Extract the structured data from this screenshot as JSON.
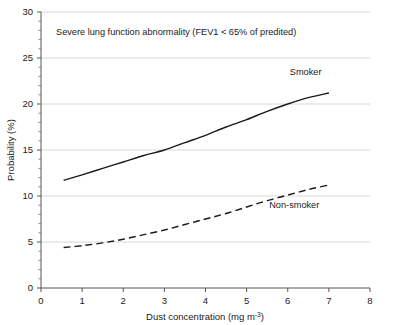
{
  "chart_data": {
    "type": "line",
    "title": "",
    "annotation": "Severe lung function abnormality (FEV1 < 65% of predited)",
    "xlabel_text": "Dust concentration (mg m",
    "xlabel_sup": "-3",
    "xlabel_tail": ")",
    "xlabel": "Dust concentration (mg m-3)",
    "ylabel": "Probability (%)",
    "xlim": [
      0,
      8
    ],
    "ylim": [
      0,
      30
    ],
    "xticks": [
      0,
      1,
      2,
      3,
      4,
      5,
      6,
      7,
      8
    ],
    "yticks": [
      0,
      5,
      10,
      15,
      20,
      25,
      30
    ],
    "xtick_labels": [
      "0",
      "1",
      "2",
      "3",
      "4",
      "5",
      "6",
      "7",
      "8"
    ],
    "ytick_labels": [
      "0",
      "5",
      "10",
      "15",
      "20",
      "25",
      "30"
    ],
    "y_minor_tick_step": 1,
    "grid": "horizontal",
    "grid_color": "#d8d8d8",
    "legend_position": "inline-annotation",
    "series": [
      {
        "name": "Smoker",
        "style": "solid",
        "color": "#1a1a1a",
        "label_x": 6.05,
        "label_y": 23.1,
        "x": [
          0.55,
          1.0,
          1.5,
          2.0,
          2.5,
          3.0,
          3.5,
          4.0,
          4.5,
          5.0,
          5.5,
          6.0,
          6.5,
          7.0
        ],
        "values": [
          11.7,
          12.3,
          13.0,
          13.7,
          14.4,
          15.0,
          15.8,
          16.6,
          17.5,
          18.3,
          19.2,
          20.0,
          20.7,
          21.2
        ]
      },
      {
        "name": "Non-smoker",
        "style": "dashed",
        "color": "#1a1a1a",
        "label_x": 5.55,
        "label_y": 8.7,
        "x": [
          0.55,
          1.0,
          1.5,
          2.0,
          2.5,
          3.0,
          3.5,
          4.0,
          4.5,
          5.0,
          5.5,
          6.0,
          6.5,
          7.0
        ],
        "values": [
          4.4,
          4.6,
          4.9,
          5.3,
          5.8,
          6.3,
          6.9,
          7.5,
          8.1,
          8.8,
          9.5,
          10.1,
          10.7,
          11.2
        ]
      }
    ]
  }
}
